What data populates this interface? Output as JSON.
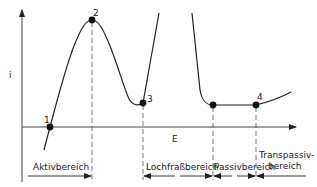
{
  "diagram": {
    "type": "current-density potential curve (Stromdichte-Potential-Kurve)",
    "axes": {
      "y_label": "i",
      "x_label": "E"
    },
    "points": [
      {
        "id": "1",
        "label": "1",
        "x": 50,
        "y": 127
      },
      {
        "id": "2",
        "label": "2",
        "x": 92,
        "y": 20
      },
      {
        "id": "3",
        "label": "3",
        "x": 143,
        "y": 103
      },
      {
        "id": "4a",
        "label": "",
        "x": 213,
        "y": 105
      },
      {
        "id": "4",
        "label": "4",
        "x": 256,
        "y": 105
      }
    ],
    "regions": [
      {
        "name": "aktivbereich",
        "label": "Aktivbereich"
      },
      {
        "name": "lochfrassbereich",
        "label": "Lochfraßbereich"
      },
      {
        "name": "passivbereich",
        "label": "Passivbereich"
      },
      {
        "name": "transpassivbereich",
        "label_line1": "Transpassiv-",
        "label_line2": "bereich"
      }
    ],
    "colors": {
      "line": "#222222",
      "background": "#ffffff"
    }
  }
}
